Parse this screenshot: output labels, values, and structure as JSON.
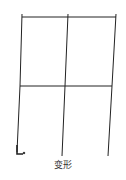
{
  "diagram": {
    "type": "deformed-frame",
    "caption": "变形",
    "stroke_color": "#222222",
    "nodes": {
      "top_left": [
        22,
        17
      ],
      "top_mid": [
        68,
        17
      ],
      "top_right": [
        116,
        17
      ],
      "mid_left": [
        20,
        86
      ],
      "mid_mid": [
        65,
        86
      ],
      "mid_right": [
        112,
        86
      ],
      "base_left": [
        17,
        152
      ],
      "base_mid": [
        62,
        156
      ],
      "base_right": [
        108,
        156
      ]
    },
    "support_symbol": "hook-at-base-left"
  }
}
